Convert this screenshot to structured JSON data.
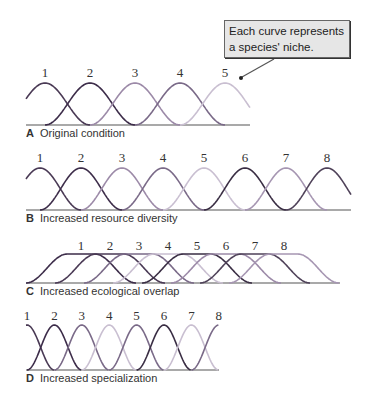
{
  "callout": {
    "text": "Each curve represents a species' niche."
  },
  "panels": [
    {
      "letter": "A",
      "title": "Original condition",
      "labels": [
        "1",
        "2",
        "3",
        "4",
        "5"
      ]
    },
    {
      "letter": "B",
      "title": "Increased resource diversity",
      "labels": [
        "1",
        "2",
        "3",
        "4",
        "5",
        "6",
        "7",
        "8"
      ]
    },
    {
      "letter": "C",
      "title": "Increased ecological overlap",
      "labels": [
        "1",
        "2",
        "3",
        "4",
        "5",
        "6",
        "7",
        "8"
      ]
    },
    {
      "letter": "D",
      "title": "Increased specialization",
      "labels": [
        "1",
        "2",
        "3",
        "4",
        "5",
        "6",
        "7",
        "8"
      ]
    }
  ],
  "colors": {
    "c1": "#4a3a55",
    "c2": "#3d2d4a",
    "c3": "#9c8aa8",
    "c4": "#7a6a88",
    "c5": "#c9bfd1",
    "c6": "#3a2e44",
    "c7": "#a696b2",
    "c8": "#4f4259"
  }
}
